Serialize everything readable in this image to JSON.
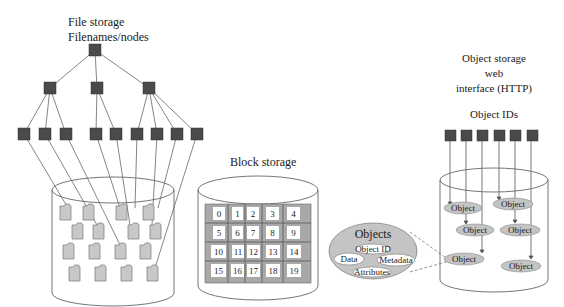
{
  "file_storage": {
    "title": "File storage",
    "subtitle": "Filenames/nodes"
  },
  "block_storage": {
    "title": "Block storage",
    "blocks": [
      "0",
      "1",
      "2",
      "3",
      "4",
      "5",
      "6",
      "7",
      "8",
      "9",
      "10",
      "11",
      "12",
      "13",
      "14",
      "15",
      "16",
      "17",
      "18",
      "19"
    ]
  },
  "object_storage": {
    "title_line1": "Object storage",
    "title_line2": "web",
    "title_line3": "interface (HTTP)",
    "ids_label": "Object IDs",
    "object_label": "Object",
    "objects": [
      "Object",
      "Object",
      "Object",
      "Object",
      "Object",
      "Object"
    ]
  },
  "objects_detail": {
    "title": "Objects",
    "object_id": "Object ID",
    "data": "Data",
    "metadata": "Metadata",
    "attributes": "Attributes"
  },
  "colors": {
    "node": "#4a4a4a",
    "line": "#555555",
    "file_fill": "#c8c8c8",
    "block_bg": "#a8a8a8",
    "object_fill": "#c4c4c4"
  }
}
